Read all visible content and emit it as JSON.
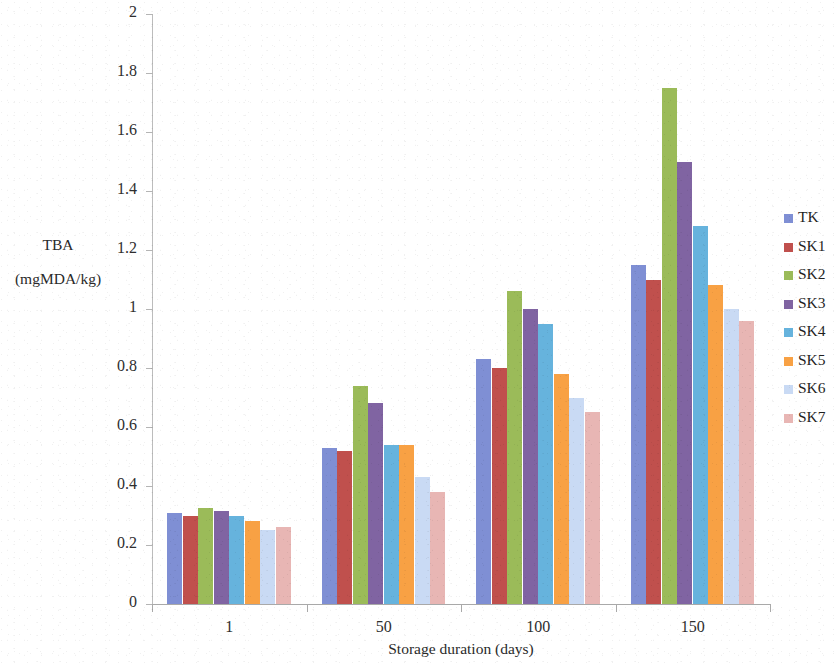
{
  "chart_data": {
    "type": "bar",
    "title": "",
    "xlabel": "Storage duration (days)",
    "ylabel": "TBA (mgMDA/kg)",
    "ylabel_line1": "TBA",
    "ylabel_line2": "(mgMDA/kg)",
    "categories": [
      "1",
      "50",
      "100",
      "150"
    ],
    "ylim": [
      0,
      2
    ],
    "ytick_step": 0.2,
    "yticks": [
      "0",
      "0.2",
      "0.4",
      "0.6",
      "0.8",
      "1",
      "1.2",
      "1.4",
      "1.6",
      "1.8",
      "2"
    ],
    "ytick_values": [
      0,
      0.2,
      0.4,
      0.6,
      0.8,
      1,
      1.2,
      1.4,
      1.6,
      1.8,
      2
    ],
    "grid": false,
    "legend_position": "right",
    "series": [
      {
        "name": "TK",
        "color": "#7f8fd4",
        "values": [
          0.31,
          0.53,
          0.83,
          1.15
        ]
      },
      {
        "name": "SK1",
        "color": "#c0504d",
        "values": [
          0.3,
          0.52,
          0.8,
          1.1
        ]
      },
      {
        "name": "SK2",
        "color": "#9bbb59",
        "values": [
          0.325,
          0.74,
          1.06,
          1.75
        ]
      },
      {
        "name": "SK3",
        "color": "#8064a2",
        "values": [
          0.315,
          0.68,
          1.0,
          1.5
        ]
      },
      {
        "name": "SK4",
        "color": "#66b3dd",
        "values": [
          0.3,
          0.54,
          0.95,
          1.28
        ]
      },
      {
        "name": "SK5",
        "color": "#f8a144",
        "values": [
          0.28,
          0.54,
          0.78,
          1.08
        ]
      },
      {
        "name": "SK6",
        "color": "#c9daf4",
        "values": [
          0.25,
          0.43,
          0.7,
          1.0
        ]
      },
      {
        "name": "SK7",
        "color": "#e8b6b4",
        "values": [
          0.26,
          0.38,
          0.65,
          0.96
        ]
      }
    ]
  }
}
